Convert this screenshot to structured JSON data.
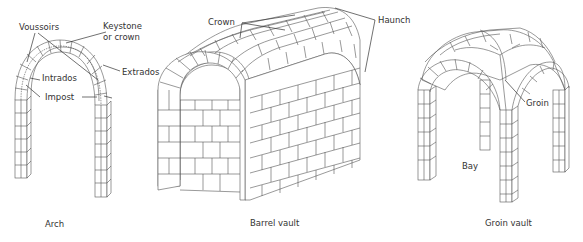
{
  "diagrams": [
    {
      "id": "arch",
      "caption": "Arch",
      "labels": {
        "voussoirs": "Voussoirs",
        "keystone_1": "Keystone",
        "keystone_2": "or crown",
        "intrados": "Intrados",
        "extrados": "Extrados",
        "impost": "Impost"
      }
    },
    {
      "id": "barrel-vault",
      "caption": "Barrel vault",
      "labels": {
        "crown": "Crown",
        "haunch": "Haunch"
      }
    },
    {
      "id": "groin-vault",
      "caption": "Groin vault",
      "labels": {
        "groin": "Groin",
        "bay": "Bay"
      }
    }
  ],
  "colors": {
    "line": "#555555",
    "text": "#333333",
    "background": "#ffffff"
  }
}
